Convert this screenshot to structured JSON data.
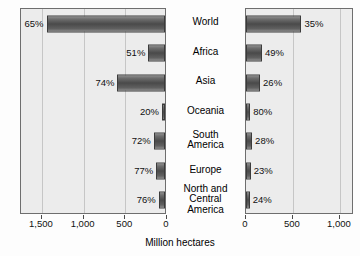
{
  "chart_data": {
    "type": "bar",
    "title": "",
    "subtitle": "",
    "xlabel": "Million hectares",
    "ylabel": "",
    "orientation": "horizontal",
    "layout": "back-to-back bidirectional bar chart",
    "grid": true,
    "legend": null,
    "categories": [
      "World",
      "Africa",
      "Asia",
      "Oceania",
      "South\nAmerica",
      "Europe",
      "North and\nCentral\nAmerica"
    ],
    "panels": [
      {
        "name": "left",
        "direction": "right-to-left",
        "xlim": [
          1750,
          0
        ],
        "ticks": [
          1500,
          1000,
          500,
          0
        ],
        "tick_labels": [
          "1,500",
          "1,000",
          "500",
          "0"
        ],
        "unit": "Million hectares",
        "values": [
          1420,
          200,
          570,
          15,
          135,
          105,
          75
        ],
        "data_labels": [
          "65%",
          "51%",
          "74%",
          "20%",
          "72%",
          "77%",
          "76%"
        ]
      },
      {
        "name": "right",
        "direction": "left-to-right",
        "xlim": [
          0,
          1150
        ],
        "ticks": [
          0,
          500,
          1000
        ],
        "tick_labels": [
          "0",
          "500",
          "1,000"
        ],
        "unit": "Million hectares",
        "values": [
          590,
          170,
          150,
          45,
          65,
          50,
          40
        ],
        "data_labels": [
          "35%",
          "49%",
          "26%",
          "80%",
          "28%",
          "23%",
          "24%"
        ]
      }
    ],
    "colors": {
      "bar_fill_dark": "#4a4a4a",
      "bar_fill_light": "#8d8d8d",
      "bar_border": "#3b3b3b",
      "panel_background": "#ececec",
      "panel_border": "#6e6e6e",
      "gridline": "#c6c6c6",
      "text": "#111111",
      "page_background": "#fdfdfd"
    }
  }
}
